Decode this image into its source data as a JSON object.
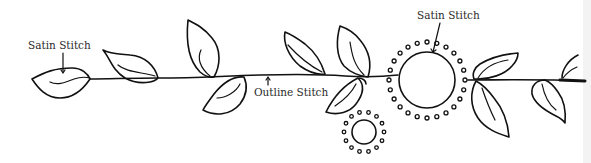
{
  "diagram": {
    "labels": {
      "satin_left": "Satin Stitch",
      "outline": "Outline Stitch",
      "satin_right": "Satin Stitch"
    },
    "elements": {
      "stem": "Main vine stem (outline stitch)",
      "leaves_count": 12,
      "flowers": [
        {
          "name": "large-flower",
          "center": [
            427,
            80
          ],
          "inner_radius": 28,
          "dot_ring_radius": 38,
          "dots": 24
        },
        {
          "name": "small-flower",
          "center": [
            364,
            132
          ],
          "inner_radius": 12,
          "dot_ring_radius": 20,
          "dots": 14
        }
      ]
    },
    "colors": {
      "ink": "#111111",
      "label_text": "#2a2a2a",
      "background": "#ffffff",
      "edge_strip": "#f3f3f4"
    }
  }
}
